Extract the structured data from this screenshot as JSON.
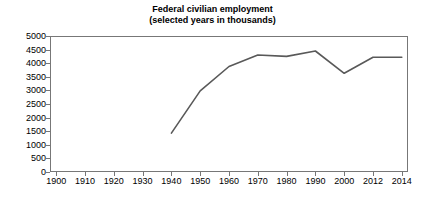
{
  "chart_data": {
    "type": "line",
    "title": "Federal civilian employment",
    "subtitle": "(selected years in thousands)",
    "title_line1": "Federal civilian employment",
    "title_line2": "(selected years in thousands)",
    "xlabel": "",
    "ylabel": "",
    "grid": false,
    "legend": false,
    "ylim": [
      0,
      5000
    ],
    "ytick_labels": [
      "5000",
      "4500",
      "4000",
      "3500",
      "3000",
      "2500",
      "2000",
      "1500",
      "1000",
      "500",
      "0"
    ],
    "ytick_values": [
      5000,
      4500,
      4000,
      3500,
      3000,
      2500,
      2000,
      1500,
      1000,
      500,
      0
    ],
    "categories": [
      "1900",
      "1910",
      "1920",
      "1930",
      "1940",
      "1950",
      "1960",
      "1970",
      "1980",
      "1990",
      "2000",
      "2012",
      "2014"
    ],
    "series": [
      {
        "name": "Federal civilian employment",
        "color": "#595959",
        "x": [
          "1940",
          "1950",
          "1960",
          "1970",
          "1980",
          "1990",
          "2000",
          "2012",
          "2014"
        ],
        "values": [
          1430,
          2980,
          3880,
          4300,
          4250,
          4450,
          3630,
          4220,
          4220
        ]
      }
    ]
  },
  "colors": {
    "line": "#595959",
    "axis": "#777777",
    "text": "#000000",
    "background": "#ffffff"
  }
}
